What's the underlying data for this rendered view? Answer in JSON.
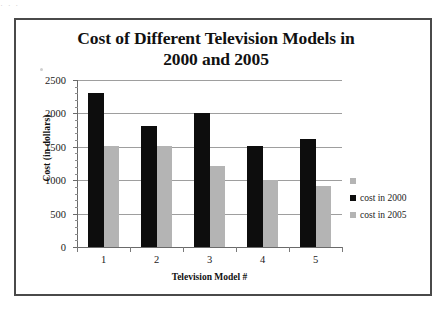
{
  "scan_artifact_text": "· · ·",
  "chart_data": {
    "type": "bar",
    "title_lines": [
      "Cost of Different Television Models in",
      "2000 and 2005"
    ],
    "xlabel": "Television Model #",
    "ylabel": "Cost (in dollars)",
    "categories": [
      "1",
      "2",
      "3",
      "4",
      "5"
    ],
    "series": [
      {
        "name": "cost in 2000",
        "color": "#0d0d0d",
        "values": [
          2300,
          1810,
          2010,
          1510,
          1620
        ]
      },
      {
        "name": "cost in 2005",
        "color": "#b4b4b4",
        "values": [
          1510,
          1510,
          1210,
          1010,
          920
        ]
      }
    ],
    "ylim": [
      0,
      2500
    ],
    "ytick_values": [
      0,
      500,
      1000,
      1500,
      2000,
      2500
    ],
    "ytick_labels": [
      "0",
      "500",
      "1000",
      "1500",
      "2000",
      "2500"
    ],
    "yminor_step": 100,
    "grid": true,
    "grid_axis": "y",
    "legend_position": "right",
    "legend_entries": [
      {
        "label": "",
        "color": "#b4b4b4"
      },
      {
        "label": "cost in 2000",
        "color": "#0d0d0d"
      },
      {
        "label": "cost in 2005",
        "color": "#b4b4b4"
      }
    ]
  }
}
